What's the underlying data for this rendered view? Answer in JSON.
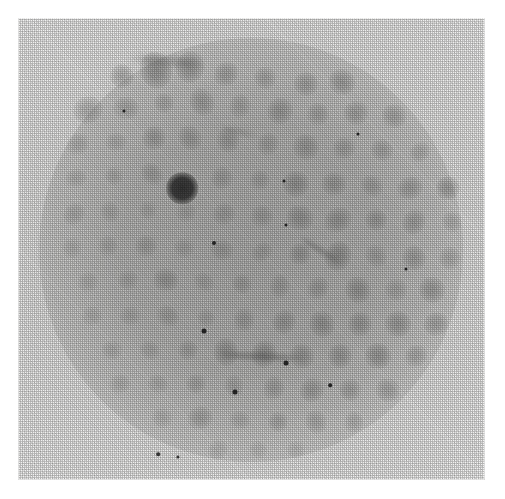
{
  "figure": {
    "kind": "diffraction-photograph",
    "caption": "",
    "plate": {
      "left": 18,
      "top": 18,
      "width": 467,
      "height": 462,
      "paper_tone": "#ececeb",
      "border_color": "#ffffff"
    },
    "halo": {
      "center_x": 233,
      "center_y": 232,
      "radius": 212,
      "tone": "#9a9a98",
      "label": "illuminated-film-disc"
    },
    "lattice": {
      "spacing_x": 36,
      "spacing_y": 35,
      "rotation_deg": -3,
      "description": "roughly square array of diffraction maxima"
    },
    "primary_spot": {
      "x": 164,
      "y": 170,
      "radius": 13,
      "tone": "#3a3a3a",
      "label": "principal-reflection"
    }
  },
  "chart_data": {
    "type": "scatter",
    "title": "",
    "xlabel": "",
    "ylabel": "",
    "xlim": [
      0,
      467
    ],
    "ylim": [
      0,
      462
    ],
    "grid": false,
    "legend": null,
    "series": [
      {
        "name": "diffraction-maxima",
        "units": "plate pixels; r = apparent spot radius; i = relative darkness 0-1",
        "points": [
          {
            "x": 104,
            "y": 58,
            "r": 13,
            "i": 0.3
          },
          {
            "x": 138,
            "y": 52,
            "r": 17,
            "i": 0.38
          },
          {
            "x": 172,
            "y": 49,
            "r": 15,
            "i": 0.34
          },
          {
            "x": 208,
            "y": 56,
            "r": 12,
            "i": 0.26
          },
          {
            "x": 247,
            "y": 60,
            "r": 11,
            "i": 0.22
          },
          {
            "x": 288,
            "y": 66,
            "r": 12,
            "i": 0.26
          },
          {
            "x": 324,
            "y": 64,
            "r": 13,
            "i": 0.3
          },
          {
            "x": 70,
            "y": 92,
            "r": 14,
            "i": 0.28
          },
          {
            "x": 108,
            "y": 90,
            "r": 12,
            "i": 0.22
          },
          {
            "x": 146,
            "y": 85,
            "r": 11,
            "i": 0.2
          },
          {
            "x": 184,
            "y": 84,
            "r": 13,
            "i": 0.26
          },
          {
            "x": 222,
            "y": 88,
            "r": 11,
            "i": 0.2
          },
          {
            "x": 262,
            "y": 93,
            "r": 13,
            "i": 0.28
          },
          {
            "x": 300,
            "y": 96,
            "r": 11,
            "i": 0.22
          },
          {
            "x": 338,
            "y": 95,
            "r": 12,
            "i": 0.26
          },
          {
            "x": 376,
            "y": 98,
            "r": 12,
            "i": 0.26
          },
          {
            "x": 60,
            "y": 126,
            "r": 11,
            "i": 0.18
          },
          {
            "x": 98,
            "y": 124,
            "r": 10,
            "i": 0.16
          },
          {
            "x": 136,
            "y": 120,
            "r": 13,
            "i": 0.26
          },
          {
            "x": 172,
            "y": 120,
            "r": 12,
            "i": 0.24
          },
          {
            "x": 210,
            "y": 122,
            "r": 12,
            "i": 0.24
          },
          {
            "x": 250,
            "y": 126,
            "r": 11,
            "i": 0.2
          },
          {
            "x": 288,
            "y": 129,
            "r": 13,
            "i": 0.26
          },
          {
            "x": 326,
            "y": 130,
            "r": 11,
            "i": 0.22
          },
          {
            "x": 364,
            "y": 132,
            "r": 11,
            "i": 0.22
          },
          {
            "x": 402,
            "y": 134,
            "r": 10,
            "i": 0.2
          },
          {
            "x": 58,
            "y": 160,
            "r": 10,
            "i": 0.16
          },
          {
            "x": 96,
            "y": 158,
            "r": 10,
            "i": 0.16
          },
          {
            "x": 134,
            "y": 156,
            "r": 11,
            "i": 0.2
          },
          {
            "x": 164,
            "y": 170,
            "r": 15,
            "i": 1.0
          },
          {
            "x": 204,
            "y": 160,
            "r": 11,
            "i": 0.2
          },
          {
            "x": 242,
            "y": 162,
            "r": 10,
            "i": 0.18
          },
          {
            "x": 278,
            "y": 166,
            "r": 13,
            "i": 0.3
          },
          {
            "x": 316,
            "y": 166,
            "r": 12,
            "i": 0.26
          },
          {
            "x": 354,
            "y": 168,
            "r": 11,
            "i": 0.22
          },
          {
            "x": 392,
            "y": 170,
            "r": 12,
            "i": 0.26
          },
          {
            "x": 430,
            "y": 170,
            "r": 13,
            "i": 0.34
          },
          {
            "x": 56,
            "y": 196,
            "r": 11,
            "i": 0.18
          },
          {
            "x": 92,
            "y": 194,
            "r": 10,
            "i": 0.16
          },
          {
            "x": 130,
            "y": 192,
            "r": 9,
            "i": 0.14
          },
          {
            "x": 168,
            "y": 194,
            "r": 10,
            "i": 0.16
          },
          {
            "x": 206,
            "y": 196,
            "r": 11,
            "i": 0.2
          },
          {
            "x": 244,
            "y": 198,
            "r": 11,
            "i": 0.2
          },
          {
            "x": 282,
            "y": 200,
            "r": 13,
            "i": 0.28
          },
          {
            "x": 320,
            "y": 202,
            "r": 13,
            "i": 0.28
          },
          {
            "x": 358,
            "y": 202,
            "r": 12,
            "i": 0.26
          },
          {
            "x": 396,
            "y": 204,
            "r": 12,
            "i": 0.26
          },
          {
            "x": 434,
            "y": 204,
            "r": 10,
            "i": 0.2
          },
          {
            "x": 54,
            "y": 230,
            "r": 10,
            "i": 0.14
          },
          {
            "x": 90,
            "y": 228,
            "r": 10,
            "i": 0.16
          },
          {
            "x": 128,
            "y": 228,
            "r": 11,
            "i": 0.2
          },
          {
            "x": 166,
            "y": 230,
            "r": 10,
            "i": 0.16
          },
          {
            "x": 204,
            "y": 232,
            "r": 11,
            "i": 0.2
          },
          {
            "x": 244,
            "y": 234,
            "r": 10,
            "i": 0.18
          },
          {
            "x": 282,
            "y": 236,
            "r": 12,
            "i": 0.26
          },
          {
            "x": 320,
            "y": 238,
            "r": 14,
            "i": 0.34
          },
          {
            "x": 358,
            "y": 238,
            "r": 11,
            "i": 0.2
          },
          {
            "x": 396,
            "y": 240,
            "r": 12,
            "i": 0.26
          },
          {
            "x": 432,
            "y": 240,
            "r": 11,
            "i": 0.22
          },
          {
            "x": 70,
            "y": 264,
            "r": 10,
            "i": 0.14
          },
          {
            "x": 110,
            "y": 262,
            "r": 10,
            "i": 0.16
          },
          {
            "x": 148,
            "y": 262,
            "r": 12,
            "i": 0.26
          },
          {
            "x": 186,
            "y": 264,
            "r": 10,
            "i": 0.16
          },
          {
            "x": 224,
            "y": 266,
            "r": 11,
            "i": 0.2
          },
          {
            "x": 262,
            "y": 268,
            "r": 11,
            "i": 0.2
          },
          {
            "x": 300,
            "y": 270,
            "r": 11,
            "i": 0.22
          },
          {
            "x": 340,
            "y": 272,
            "r": 13,
            "i": 0.3
          },
          {
            "x": 378,
            "y": 272,
            "r": 11,
            "i": 0.2
          },
          {
            "x": 414,
            "y": 272,
            "r": 13,
            "i": 0.3
          },
          {
            "x": 74,
            "y": 298,
            "r": 10,
            "i": 0.14
          },
          {
            "x": 112,
            "y": 298,
            "r": 10,
            "i": 0.16
          },
          {
            "x": 150,
            "y": 298,
            "r": 11,
            "i": 0.2
          },
          {
            "x": 188,
            "y": 300,
            "r": 10,
            "i": 0.16
          },
          {
            "x": 226,
            "y": 302,
            "r": 11,
            "i": 0.22
          },
          {
            "x": 266,
            "y": 304,
            "r": 12,
            "i": 0.26
          },
          {
            "x": 304,
            "y": 306,
            "r": 13,
            "i": 0.3
          },
          {
            "x": 342,
            "y": 306,
            "r": 12,
            "i": 0.28
          },
          {
            "x": 380,
            "y": 306,
            "r": 13,
            "i": 0.3
          },
          {
            "x": 418,
            "y": 306,
            "r": 12,
            "i": 0.28
          },
          {
            "x": 94,
            "y": 332,
            "r": 10,
            "i": 0.16
          },
          {
            "x": 132,
            "y": 332,
            "r": 10,
            "i": 0.16
          },
          {
            "x": 170,
            "y": 332,
            "r": 11,
            "i": 0.2
          },
          {
            "x": 208,
            "y": 334,
            "r": 13,
            "i": 0.3
          },
          {
            "x": 246,
            "y": 336,
            "r": 13,
            "i": 0.32
          },
          {
            "x": 284,
            "y": 338,
            "r": 12,
            "i": 0.28
          },
          {
            "x": 322,
            "y": 338,
            "r": 12,
            "i": 0.28
          },
          {
            "x": 360,
            "y": 338,
            "r": 13,
            "i": 0.32
          },
          {
            "x": 398,
            "y": 338,
            "r": 11,
            "i": 0.24
          },
          {
            "x": 102,
            "y": 366,
            "r": 10,
            "i": 0.16
          },
          {
            "x": 140,
            "y": 366,
            "r": 10,
            "i": 0.16
          },
          {
            "x": 178,
            "y": 366,
            "r": 11,
            "i": 0.2
          },
          {
            "x": 216,
            "y": 368,
            "r": 10,
            "i": 0.18
          },
          {
            "x": 256,
            "y": 370,
            "r": 11,
            "i": 0.22
          },
          {
            "x": 294,
            "y": 372,
            "r": 12,
            "i": 0.26
          },
          {
            "x": 332,
            "y": 372,
            "r": 11,
            "i": 0.24
          },
          {
            "x": 370,
            "y": 372,
            "r": 12,
            "i": 0.26
          },
          {
            "x": 144,
            "y": 400,
            "r": 10,
            "i": 0.16
          },
          {
            "x": 182,
            "y": 400,
            "r": 12,
            "i": 0.24
          },
          {
            "x": 222,
            "y": 402,
            "r": 10,
            "i": 0.16
          },
          {
            "x": 260,
            "y": 404,
            "r": 11,
            "i": 0.22
          },
          {
            "x": 298,
            "y": 404,
            "r": 11,
            "i": 0.22
          },
          {
            "x": 336,
            "y": 404,
            "r": 10,
            "i": 0.2
          },
          {
            "x": 200,
            "y": 432,
            "r": 10,
            "i": 0.16
          },
          {
            "x": 240,
            "y": 432,
            "r": 9,
            "i": 0.14
          },
          {
            "x": 278,
            "y": 432,
            "r": 9,
            "i": 0.14
          }
        ]
      },
      {
        "name": "emulsion-specks",
        "units": "plate pixels",
        "points": [
          {
            "x": 196,
            "y": 225,
            "r": 2.0
          },
          {
            "x": 268,
            "y": 207,
            "r": 1.5
          },
          {
            "x": 266,
            "y": 163,
            "r": 1.5
          },
          {
            "x": 186,
            "y": 313,
            "r": 2.5
          },
          {
            "x": 268,
            "y": 345,
            "r": 2.5
          },
          {
            "x": 217,
            "y": 374,
            "r": 2.5
          },
          {
            "x": 312,
            "y": 367,
            "r": 1.8
          },
          {
            "x": 340,
            "y": 116,
            "r": 1.5
          },
          {
            "x": 388,
            "y": 251,
            "r": 1.5
          },
          {
            "x": 140,
            "y": 436,
            "r": 1.8
          },
          {
            "x": 160,
            "y": 439,
            "r": 1.6
          },
          {
            "x": 106,
            "y": 93,
            "r": 1.5
          }
        ]
      },
      {
        "name": "streaks",
        "units": "plate pixels; x1,y1 to x2,y2",
        "segments": [
          {
            "x1": 280,
            "y1": 218,
            "x2": 324,
            "y2": 246,
            "w": 4,
            "i": 0.4,
            "label": "diagonal-smear"
          },
          {
            "x1": 196,
            "y1": 336,
            "x2": 290,
            "y2": 340,
            "w": 7,
            "i": 0.34,
            "label": "horizontal-smear"
          },
          {
            "x1": 110,
            "y1": 40,
            "x2": 188,
            "y2": 46,
            "w": 10,
            "i": 0.22,
            "label": "upper-arc-smear"
          },
          {
            "x1": 200,
            "y1": 108,
            "x2": 240,
            "y2": 118,
            "w": 5,
            "i": 0.2,
            "label": "short-smear"
          }
        ]
      }
    ]
  }
}
